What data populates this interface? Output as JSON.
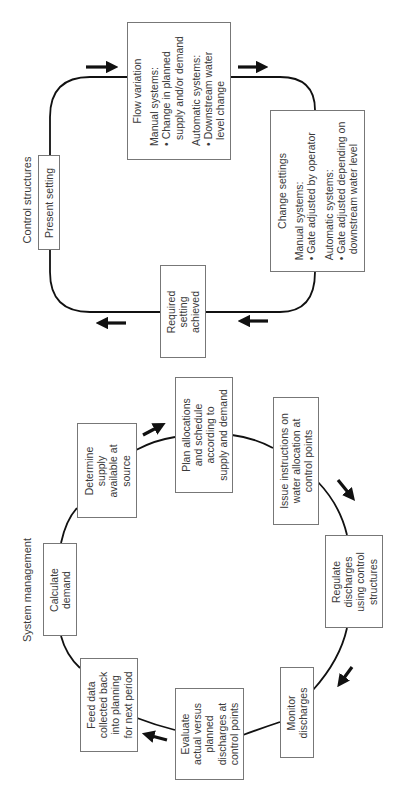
{
  "orientation": "rotated-90-ccw",
  "control_structures": {
    "title": "Control structures",
    "nodes": {
      "present_setting": {
        "label": "Present setting"
      },
      "flow_variation": {
        "heading": "Flow variation",
        "manual_title": "Manual systems:",
        "manual_items": [
          "• Change in planned",
          "  supply and/or demand"
        ],
        "auto_title": "Automatic systems:",
        "auto_items": [
          "• Downstream water",
          "  level change"
        ]
      },
      "change_settings": {
        "heading": "Change settings",
        "manual_title": "Manual systems:",
        "manual_items": [
          "• Gate adjusted by operator"
        ],
        "auto_title": "Automatic systems:",
        "auto_items": [
          "• Gate adjusted depending on",
          "  downstream water level"
        ]
      },
      "required_setting": {
        "lines": [
          "Required",
          "setting",
          "achieved"
        ]
      }
    },
    "flow_order": [
      "Present setting",
      "Flow variation",
      "Change settings",
      "Required setting achieved"
    ]
  },
  "system_management": {
    "title": "System management",
    "nodes": [
      {
        "id": "calculate_demand",
        "lines": [
          "Calculate",
          "demand"
        ]
      },
      {
        "id": "determine_supply",
        "lines": [
          "Determine",
          "supply",
          "available at",
          "source"
        ]
      },
      {
        "id": "plan_allocations",
        "lines": [
          "Plan allocations",
          "and schedule",
          "according to",
          "supply and demand"
        ]
      },
      {
        "id": "issue_instructions",
        "lines": [
          "Issue instructions on",
          "water allocation at",
          "control points"
        ]
      },
      {
        "id": "regulate_discharges",
        "lines": [
          "Regulate",
          "discharges",
          "using control",
          "structures"
        ]
      },
      {
        "id": "monitor_discharges",
        "lines": [
          "Monitor",
          "discharges"
        ]
      },
      {
        "id": "evaluate",
        "lines": [
          "Evaluate",
          "actual versus",
          "planned",
          "discharges at",
          "control points"
        ]
      },
      {
        "id": "feed_data",
        "lines": [
          "Feed data",
          "collected back",
          "into planning",
          "for next period"
        ]
      }
    ]
  },
  "colors": {
    "line": "#111111",
    "box_border": "#777777",
    "text": "#3a3a3a"
  }
}
